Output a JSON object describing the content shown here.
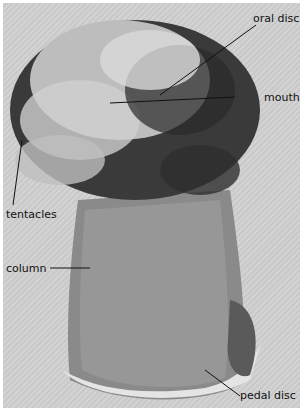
{
  "figure": {
    "labels": {
      "oral_disc": "oral disc",
      "mouth": "mouth",
      "tentacles": "tentacles",
      "column": "column",
      "pedal_disc": "pedal disc"
    }
  }
}
